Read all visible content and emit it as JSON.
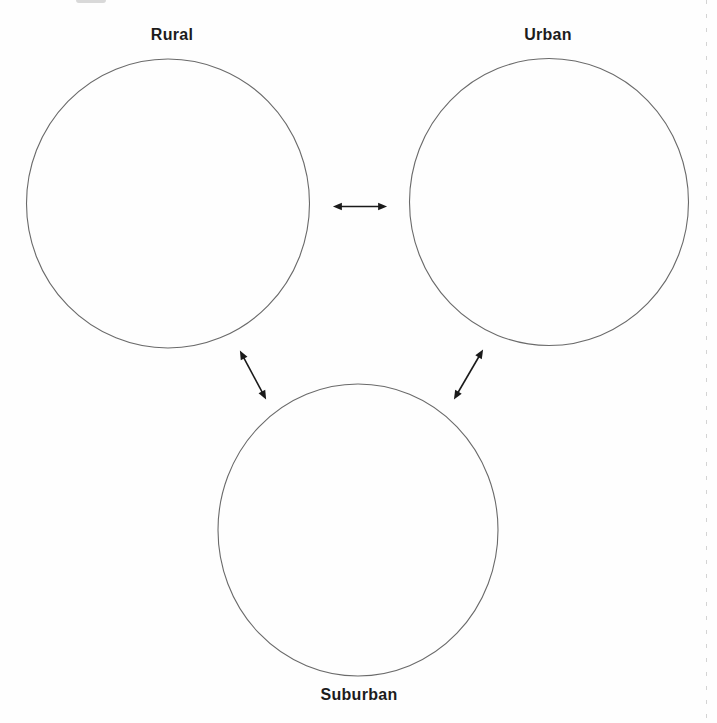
{
  "diagram": {
    "type": "graphic-organizer",
    "nodes": [
      {
        "id": "rural",
        "label": "Rural"
      },
      {
        "id": "urban",
        "label": "Urban"
      },
      {
        "id": "suburban",
        "label": "Suburban"
      }
    ],
    "edges": [
      {
        "from": "rural",
        "to": "urban",
        "bidirectional": true
      },
      {
        "from": "rural",
        "to": "suburban",
        "bidirectional": true
      },
      {
        "from": "urban",
        "to": "suburban",
        "bidirectional": true
      }
    ],
    "colors": {
      "page_background": "#fefefe",
      "circle_stroke": "#6a6a6a",
      "arrow": "#1a1a1a",
      "label_text": "#1c1c1c",
      "scan_artifact": "#b9b9b9"
    }
  }
}
